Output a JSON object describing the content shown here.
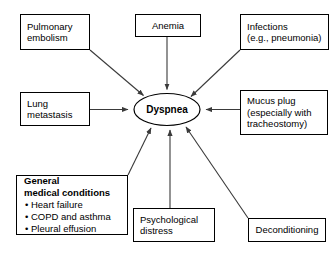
{
  "diagram": {
    "type": "concept-map",
    "center_node": {
      "id": "dyspnea",
      "label": "Dyspnea",
      "shape": "ellipse",
      "bold": true
    },
    "nodes": [
      {
        "id": "pulmonary-embolism",
        "lines": [
          "Pulmonary",
          "embolism"
        ],
        "shape": "rect",
        "x": 20,
        "y": 14,
        "w": 70,
        "h": 36
      },
      {
        "id": "anemia",
        "lines": [
          "Anemia"
        ],
        "shape": "rect",
        "x": 135,
        "y": 14,
        "w": 66,
        "h": 23
      },
      {
        "id": "infections",
        "lines": [
          "Infections",
          "(e.g., pneumonia)"
        ],
        "shape": "rect",
        "x": 240,
        "y": 14,
        "w": 89,
        "h": 36
      },
      {
        "id": "lung-metastasis",
        "lines": [
          "Lung",
          "metastasis"
        ],
        "shape": "rect",
        "x": 20,
        "y": 92,
        "w": 70,
        "h": 34
      },
      {
        "id": "mucus-plug",
        "lines": [
          "Mucus plug",
          "(especially with",
          "tracheostomy)"
        ],
        "shape": "rect",
        "x": 240,
        "y": 90,
        "w": 88,
        "h": 45
      },
      {
        "id": "general-medical-conditions",
        "heading": [
          "General",
          "medical conditions"
        ],
        "bullets": [
          "Heart failure",
          "COPD and asthma",
          "Pleural effusion"
        ],
        "shape": "rect",
        "x": 16,
        "y": 175,
        "w": 112,
        "h": 60
      },
      {
        "id": "psychological-distress",
        "lines": [
          "Psychological",
          "distress"
        ],
        "shape": "rect",
        "x": 133,
        "y": 208,
        "w": 82,
        "h": 34
      },
      {
        "id": "deconditioning",
        "lines": [
          "Deconditioning"
        ],
        "shape": "rect",
        "x": 248,
        "y": 218,
        "w": 78,
        "h": 24
      }
    ],
    "edges": [
      {
        "from": "pulmonary-embolism",
        "to": "dyspnea",
        "style": "diagonal-arrow"
      },
      {
        "from": "anemia",
        "to": "dyspnea",
        "style": "vertical-arrow"
      },
      {
        "from": "infections",
        "to": "dyspnea",
        "style": "diagonal-arrow"
      },
      {
        "from": "lung-metastasis",
        "to": "dyspnea",
        "style": "horizontal-arrow"
      },
      {
        "from": "mucus-plug",
        "to": "dyspnea",
        "style": "horizontal-arrow"
      },
      {
        "from": "general-medical-conditions",
        "to": "dyspnea",
        "style": "diagonal-arrow"
      },
      {
        "from": "psychological-distress",
        "to": "dyspnea",
        "style": "vertical-arrow"
      },
      {
        "from": "deconditioning",
        "to": "dyspnea",
        "style": "diagonal-arrow"
      }
    ],
    "colors": {
      "stroke": "#000000",
      "background": "#ffffff",
      "text": "#000000",
      "arrow": "#3a3a3a"
    },
    "bullet_glyph": "•"
  },
  "labels": {
    "pulmonary_embolism_l1": "Pulmonary",
    "pulmonary_embolism_l2": "embolism",
    "anemia_l1": "Anemia",
    "infections_l1": "Infections",
    "infections_l2": "(e.g., pneumonia)",
    "lung_metastasis_l1": "Lung",
    "lung_metastasis_l2": "metastasis",
    "mucus_plug_l1": "Mucus plug",
    "mucus_plug_l2": "(especially with",
    "mucus_plug_l3": "tracheostomy)",
    "general_h1": "General",
    "general_h2": "medical conditions",
    "general_b1": "• Heart failure",
    "general_b2": "• COPD and asthma",
    "general_b3": "• Pleural effusion",
    "psychological_l1": "Psychological",
    "psychological_l2": "distress",
    "deconditioning_l1": "Deconditioning",
    "dyspnea": "Dyspnea"
  }
}
